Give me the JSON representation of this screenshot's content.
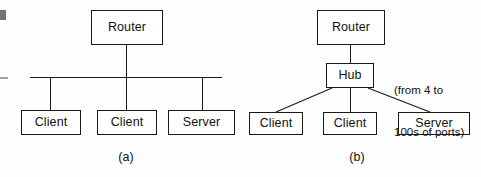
{
  "figure": {
    "background_color": "#fdfdfd",
    "line_color": "#1a1a1a",
    "text_color": "#111111",
    "width": 481,
    "height": 177
  },
  "panel_a": {
    "caption": "(a)",
    "topology": "shared bus / coaxial segment",
    "nodes": {
      "router": "Router",
      "client_left": "Client",
      "client_middle": "Client",
      "server_right": "Server"
    }
  },
  "panel_b": {
    "caption": "(b)",
    "topology": "star via hub",
    "nodes": {
      "router": "Router",
      "hub": "Hub",
      "client_left": "Client",
      "client_middle": "Client",
      "server_right": "Server"
    },
    "annotation_line1": "(from 4 to",
    "annotation_line2": "100s of ports)"
  }
}
